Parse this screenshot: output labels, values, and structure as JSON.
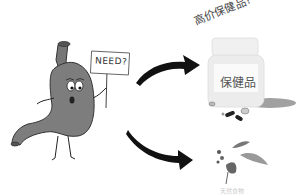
{
  "illustration": {
    "character": "stomach",
    "sign_text": "NEED?",
    "question_text": "高价保健品?",
    "bottle_label": "保健品",
    "herb_label": "天然食物",
    "colors": {
      "stomach": "#7a7a7a",
      "arrow": "#111111",
      "bottle": "#ededed",
      "shadow": "#8a8a8a"
    }
  }
}
